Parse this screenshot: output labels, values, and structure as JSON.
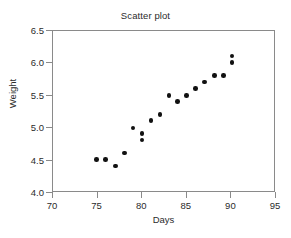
{
  "chart_data": {
    "type": "scatter",
    "title": "Scatter plot",
    "xlabel": "Days",
    "ylabel": "Weight",
    "xlim": [
      70,
      95
    ],
    "ylim": [
      4.0,
      6.5
    ],
    "xticks": [
      70,
      75,
      80,
      85,
      90,
      95
    ],
    "xtick_labels": [
      "70",
      "75",
      "80",
      "85",
      "90",
      "95"
    ],
    "yticks": [
      4.0,
      4.5,
      5.0,
      5.5,
      6.0,
      6.5
    ],
    "ytick_labels": [
      "4.0",
      "4.5",
      "5.0",
      "5.5",
      "6.0",
      "6.5"
    ],
    "grid": false,
    "legend": null,
    "marker": "filled-circle",
    "marker_color": "#111111",
    "axis_color": "#8a8a8a",
    "background": "#ffffff",
    "points": [
      {
        "x": 75.0,
        "y": 4.5
      },
      {
        "x": 76.0,
        "y": 4.5
      },
      {
        "x": 77.1,
        "y": 4.4
      },
      {
        "x": 78.1,
        "y": 4.6
      },
      {
        "x": 79.1,
        "y": 4.99
      },
      {
        "x": 80.1,
        "y": 4.9
      },
      {
        "x": 80.1,
        "y": 4.8
      },
      {
        "x": 81.1,
        "y": 5.1
      },
      {
        "x": 82.1,
        "y": 5.2
      },
      {
        "x": 83.1,
        "y": 5.49
      },
      {
        "x": 84.1,
        "y": 5.4
      },
      {
        "x": 85.1,
        "y": 5.49
      },
      {
        "x": 86.1,
        "y": 5.6
      },
      {
        "x": 87.1,
        "y": 5.7
      },
      {
        "x": 88.2,
        "y": 5.8
      },
      {
        "x": 89.2,
        "y": 5.8
      },
      {
        "x": 90.2,
        "y": 6.1
      },
      {
        "x": 90.2,
        "y": 6.0
      }
    ]
  }
}
